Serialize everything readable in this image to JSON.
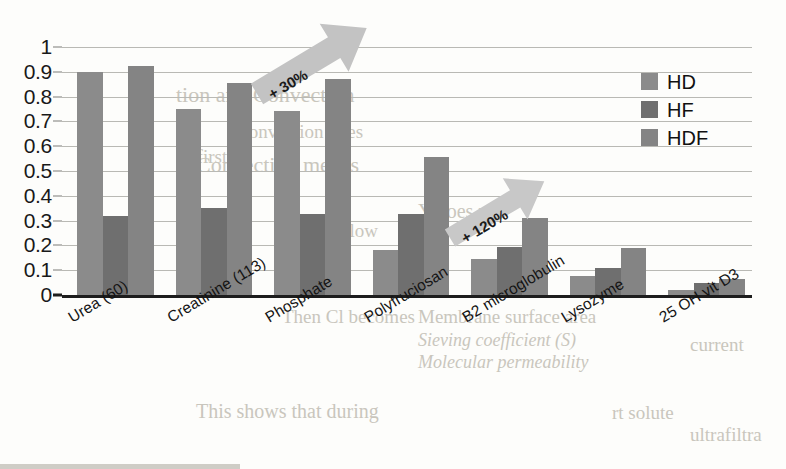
{
  "chart_data": {
    "type": "bar",
    "title": "",
    "subtitle": "",
    "xlabel": "",
    "ylabel": "",
    "ylim": [
      0,
      1
    ],
    "yticks": [
      "0",
      "0.1",
      "0.2",
      "0.3",
      "0.4",
      "0.5",
      "0.6",
      "0.7",
      "0.8",
      "0.9",
      "1"
    ],
    "ytick_values": [
      0,
      0.1,
      0.2,
      0.3,
      0.4,
      0.5,
      0.6,
      0.7,
      0.8,
      0.9,
      1
    ],
    "grid": true,
    "legend_position": "upper right",
    "categories": [
      "Urea (60)",
      "Creatinine (113)",
      "Phosphate",
      "Polyfruciosan",
      "B2 microglobulin",
      "Lysozyme",
      "25 OH vit D3"
    ],
    "series": [
      {
        "name": "HD",
        "color": "#8b8b8b",
        "values": [
          0.9,
          0.75,
          0.74,
          0.18,
          0.145,
          0.075,
          0.02
        ]
      },
      {
        "name": "HF",
        "color": "#6f6f6f",
        "values": [
          0.32,
          0.35,
          0.325,
          0.325,
          0.195,
          0.11,
          0.05
        ]
      },
      {
        "name": "HDF",
        "color": "#848484",
        "values": [
          0.925,
          0.855,
          0.87,
          0.555,
          0.31,
          0.19,
          0.065
        ]
      }
    ],
    "annotations": [
      {
        "label": "+ 30%",
        "name": "arrow-annotation-30",
        "angle": -31
      },
      {
        "label": "+ 120%",
        "name": "arrow-annotation-120",
        "angle": -31
      }
    ]
  },
  "legend": {
    "items": [
      {
        "label": "HD",
        "color": "#8b8b8b"
      },
      {
        "label": "HF",
        "color": "#6f6f6f"
      },
      {
        "label": "HDF",
        "color": "#848484"
      }
    ]
  },
  "background_text": [
    "tion and Convection",
    "Convection does",
    "of first",
    "Convection means",
    "Y does not",
    "how low",
    "Membrane surface area",
    "Sieving coefficient (S)",
    "Molecular permeability",
    "This shows that during",
    "Then Cl becomes",
    "current",
    "rt solute",
    "ultrafiltra"
  ]
}
